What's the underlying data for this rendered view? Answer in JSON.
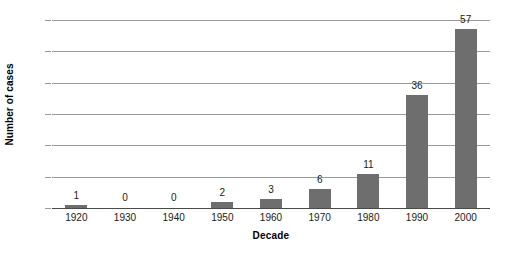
{
  "chart_data": {
    "type": "bar",
    "title": "",
    "subtitle": "",
    "xlabel": "Decade",
    "ylabel": "Number of cases",
    "categories": [
      "1920",
      "1930",
      "1940",
      "1950",
      "1960",
      "1970",
      "1980",
      "1990",
      "2000"
    ],
    "values": [
      1,
      0,
      0,
      2,
      3,
      6,
      11,
      36,
      57
    ],
    "value_labels": [
      "1",
      "0",
      "0",
      "2",
      "3",
      "6",
      "11",
      "36",
      "57"
    ],
    "ylim": [
      0,
      60
    ],
    "ytick_values": [
      0,
      10,
      20,
      30,
      40,
      50,
      60
    ],
    "ytick_labels": [
      "0",
      "10",
      "20",
      "30",
      "40",
      "50",
      "60"
    ],
    "grid": true,
    "grid_axis": "y",
    "legend": false,
    "legend_position": "none",
    "bar_color": "#6e6e6e",
    "gridline_color": "#9a9a9a",
    "axis_color": "#4a4a4a",
    "background_color": "#ffffff",
    "data_labels_shown": true
  }
}
